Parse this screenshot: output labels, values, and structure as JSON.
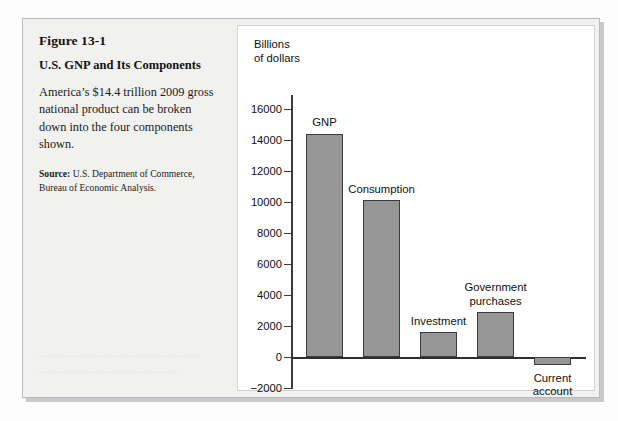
{
  "figure": {
    "number": "Figure 13-1",
    "title": "U.S. GNP and Its Components",
    "description": "America’s $14.4 trillion 2009 gross national product can be broken down into the four components shown.",
    "source_label": "Source:",
    "source_text": " U.S. Department of Commerce, Bureau of Economic Analysis."
  },
  "bleed_through": {
    "line1": "— ——— ——— —— ————",
    "line2": "——— ———— —————"
  },
  "colors": {
    "bar_fill": "#969696",
    "bar_stroke": "#3b3b3b",
    "axis": "#2e2e2e",
    "panel_background": "#f1f1f0",
    "chart_background": "#ffffff"
  },
  "chart_data": {
    "type": "bar",
    "title": "U.S. GNP and Its Components",
    "xlabel": "",
    "ylabel": "Billions\nof dollars",
    "categories": [
      "GNP",
      "Consumption",
      "Investment",
      "Government purchases",
      "Current account"
    ],
    "values": [
      14400,
      10100,
      1600,
      2900,
      -500
    ],
    "ylim": [
      -2000,
      16000
    ],
    "ytick_labels": [
      "16000",
      "14000",
      "12000",
      "10000",
      "8000",
      "6000",
      "4000",
      "2000",
      "0",
      "−2000"
    ],
    "ytick_values": [
      16000,
      14000,
      12000,
      10000,
      8000,
      6000,
      4000,
      2000,
      0,
      -2000
    ],
    "grid": false,
    "legend": false,
    "bar_labels": [
      {
        "text": "GNP",
        "position": "above"
      },
      {
        "text": "Consumption",
        "position": "above"
      },
      {
        "text": "Investment",
        "position": "above"
      },
      {
        "text": "Government\npurchases",
        "position": "above"
      },
      {
        "text": "Current\naccount",
        "position": "below"
      }
    ]
  }
}
